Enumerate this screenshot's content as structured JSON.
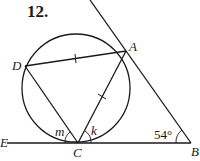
{
  "problem": {
    "number": "12."
  },
  "points": {
    "A": {
      "label": "A"
    },
    "B": {
      "label": "B"
    },
    "C": {
      "label": "C"
    },
    "D": {
      "label": "D"
    },
    "E": {
      "label": "E"
    }
  },
  "angles": {
    "m": "m",
    "k": "k",
    "B": "54°"
  },
  "colors": {
    "stroke": "#1a1a1a",
    "background": "#ffffff"
  }
}
